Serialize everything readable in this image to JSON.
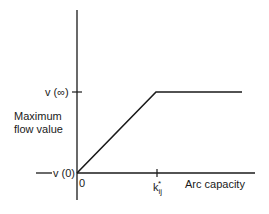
{
  "diagram": {
    "type": "piecewise-linear function plot",
    "y_axis": {
      "label_line1": "Maximum",
      "label_line2": "flow  value",
      "tick_top": "v (∞)",
      "tick_bottom": "v (0)"
    },
    "x_axis": {
      "label": "Arc  capacity",
      "origin": "0",
      "tick_k_base": "k",
      "tick_k_sub": "ij",
      "tick_k_sup": "*"
    },
    "curve": {
      "description": "Rises linearly from v(0) at capacity 0 to v(∞) at capacity k*ij, then constant",
      "points": [
        {
          "x": "0",
          "y": "v(0)"
        },
        {
          "x": "k*ij",
          "y": "v(∞)"
        },
        {
          "x": "beyond",
          "y": "v(∞)"
        }
      ]
    },
    "colors": {
      "line": "#1a1a1a",
      "background": "#ffffff"
    }
  }
}
